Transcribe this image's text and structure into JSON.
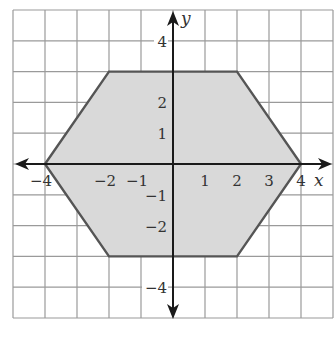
{
  "chart_data": {
    "type": "polygon",
    "title": "",
    "xlabel": "x",
    "ylabel": "y",
    "xlim": [
      -5,
      5
    ],
    "ylim": [
      -5,
      5
    ],
    "grid": true,
    "grid_step": 1,
    "x_tick_labels": [
      "-4",
      "-2",
      "-1",
      "1",
      "2",
      "3",
      "4"
    ],
    "x_tick_values": [
      -4,
      -2,
      -1,
      1,
      2,
      3,
      4
    ],
    "y_tick_labels": [
      "4",
      "2",
      "1",
      "-1",
      "-2",
      "-4"
    ],
    "y_tick_values": [
      4,
      2,
      1,
      -1,
      -2,
      -4
    ],
    "shape": {
      "name": "hexagon",
      "vertices": [
        [
          -4,
          0
        ],
        [
          -2,
          3
        ],
        [
          2,
          3
        ],
        [
          4,
          0
        ],
        [
          2,
          -3
        ],
        [
          -2,
          -3
        ]
      ],
      "fill": "#d9d9d9",
      "stroke": "#555555"
    },
    "colors": {
      "grid": "#9a9a9a",
      "axis": "#1a1a1a",
      "text": "#333333"
    }
  },
  "labels": {
    "x_axis": "x",
    "y_axis": "y",
    "x_ticks": [
      "−4",
      "−2",
      "−1",
      "1",
      "2",
      "3",
      "4"
    ],
    "y_ticks": [
      "4",
      "2",
      "1",
      "−1",
      "−2",
      "−4"
    ]
  }
}
